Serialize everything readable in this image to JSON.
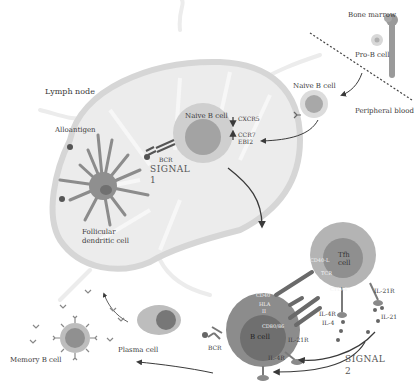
{
  "locations": {
    "bone_marrow": "Bone marrow",
    "peripheral_blood": "Peripheral blood",
    "lymph_node": "Lymph node"
  },
  "cells": {
    "pro_b": "Pro-B cell",
    "naive_b_outside": "Naive B cell",
    "naive_b_inside": "Naive B cell",
    "fdc_line1": "Follicular",
    "fdc_line2": "dendritic cell",
    "b_cell": "B cell",
    "tfh_line1": "Tfh",
    "tfh_line2": "cell",
    "plasma": "Plasma cell",
    "memory_b": "Memory B cell"
  },
  "molecules": {
    "alloantigen": "Alloantigen",
    "bcr_signal1": "BCR",
    "cxcr5": "CXCR5",
    "ccr7": "CCR7",
    "ebi2": "EBI2",
    "cd40": "CD40",
    "hla_line1": "HLA",
    "hla_line2": "II",
    "cd80_86": "CD80/86",
    "cd40l": "CD40-L",
    "tcr": "TCR",
    "ctla4": "CTLA4",
    "il21r_b": "IL-21R",
    "il4r_b": "IL-4R",
    "il4r_t": "IL-4R",
    "il4": "IL-4",
    "il21r_t": "IL-21R",
    "il21": "IL-21",
    "bcr_bottom": "BCR"
  },
  "signals": {
    "signal1_word": "SIGNAL",
    "signal1_num": "1",
    "signal2_word": "SIGNAL",
    "signal2_num": "2"
  },
  "colors": {
    "node_fill": "#e9e9e9",
    "node_outline": "#d2d2d2",
    "cell_outer": "#cfcfcf",
    "cell_inner": "#a3a3a3",
    "b_cell_outer": "#8c8c8c",
    "b_cell_inner": "#6f6f6f",
    "tfh_outer": "#b4b4b4",
    "tfh_inner": "#8f8f8f",
    "arrow": "#3a3a3a"
  }
}
